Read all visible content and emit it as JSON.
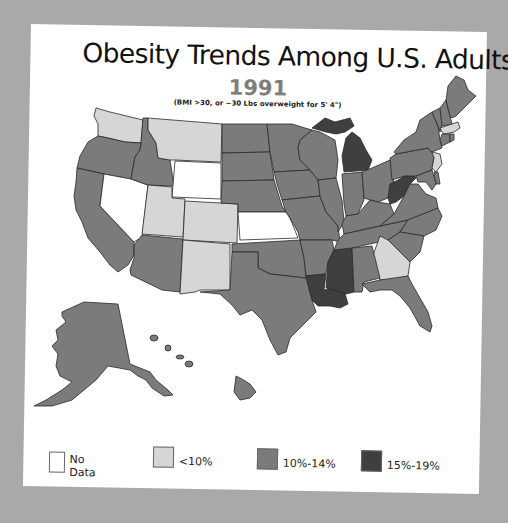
{
  "title": "Obesity Trends Among U.S. Adults",
  "year": "1991",
  "subtitle": "(BMI >30, or ~30 Lbs overweight for 5' 4\")",
  "colors": {
    "background": "#a9a9a9",
    "card": "#ffffff",
    "no_data": "#ffffff",
    "lt10": "#d6d6d6",
    "p10_14": "#7b7b7b",
    "p15_19": "#3f3f3f"
  },
  "legend": [
    {
      "key": "no_data",
      "label": "No Data",
      "color": "#ffffff"
    },
    {
      "key": "lt10",
      "label": "<10%",
      "color": "#d6d6d6"
    },
    {
      "key": "p10_14",
      "label": "10%-14%",
      "color": "#7b7b7b"
    },
    {
      "key": "p15_19",
      "label": "15%-19%",
      "color": "#3f3f3f"
    }
  ],
  "states": {
    "no_data": [
      "Nevada",
      "Wyoming",
      "Kansas"
    ],
    "lt10": [
      "Washington",
      "Montana",
      "Utah",
      "Colorado",
      "New Mexico",
      "Georgia",
      "Massachusetts",
      "New Jersey"
    ],
    "p10_14": [
      "Oregon",
      "California",
      "Idaho",
      "Arizona",
      "North Dakota",
      "South Dakota",
      "Nebraska",
      "Oklahoma",
      "Texas",
      "Minnesota",
      "Iowa",
      "Missouri",
      "Arkansas",
      "Wisconsin",
      "Illinois",
      "Indiana",
      "Ohio",
      "Kentucky",
      "Tennessee",
      "Alabama",
      "Florida",
      "South Carolina",
      "North Carolina",
      "Virginia",
      "Maryland",
      "Delaware",
      "Pennsylvania",
      "New York",
      "Vermont",
      "New Hampshire",
      "Maine",
      "Connecticut",
      "Rhode Island",
      "Alaska",
      "Hawaii"
    ],
    "p15_19": [
      "Michigan",
      "West Virginia",
      "Mississippi",
      "Louisiana"
    ]
  }
}
